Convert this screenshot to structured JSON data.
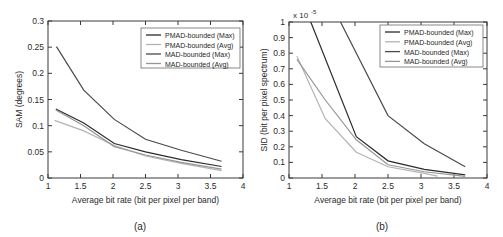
{
  "figure": {
    "background": "#ffffff",
    "panels": [
      "a",
      "b"
    ]
  },
  "colors": {
    "dark": "#2b2b2b",
    "mid_dark": "#4a4a4a",
    "light_gray": "#b3b3b3",
    "mid_gray": "#969696",
    "axis": "#3a3a3a"
  },
  "legend": {
    "entries": [
      {
        "label": "PMAD-bounded (Max)",
        "color": "#2b2b2b"
      },
      {
        "label": "PMAD-bounded (Avg)",
        "color": "#b3b3b3"
      },
      {
        "label": "MAD-bounded (Max)",
        "color": "#4a4a4a"
      },
      {
        "label": "MAD-bounded (Avg)",
        "color": "#969696"
      }
    ]
  },
  "chart_data": [
    {
      "type": "line",
      "panel": "a",
      "caption": "(a)",
      "title": "",
      "xlabel": "Average bit rate (bit per pixel per band)",
      "ylabel": "SAM (degrees)",
      "xlim": [
        1,
        4
      ],
      "ylim": [
        0,
        0.3
      ],
      "xticks": [
        1,
        1.5,
        2,
        2.5,
        3,
        3.5,
        4
      ],
      "xticklabels": [
        "1",
        "1.5",
        "2",
        "2.5",
        "3",
        "3.5",
        "4"
      ],
      "yticks": [
        0,
        0.05,
        0.1,
        0.15,
        0.2,
        0.25,
        0.3
      ],
      "yticklabels": [
        "0",
        "0.05",
        "0.1",
        "0.15",
        "0.2",
        "0.25",
        "0.3"
      ],
      "grid": false,
      "legend_position": "top-right",
      "series": [
        {
          "name": "PMAD-bounded (Max)",
          "color": "#2b2b2b",
          "x": [
            1.12,
            1.55,
            2.02,
            2.5,
            3.05,
            3.67
          ],
          "y": [
            0.132,
            0.105,
            0.066,
            0.05,
            0.035,
            0.022
          ]
        },
        {
          "name": "PMAD-bounded (Avg)",
          "color": "#b3b3b3",
          "x": [
            1.1,
            1.55,
            2.02,
            2.5,
            3.05,
            3.67
          ],
          "y": [
            0.11,
            0.09,
            0.062,
            0.042,
            0.028,
            0.014
          ]
        },
        {
          "name": "MAD-bounded (Max)",
          "color": "#4a4a4a",
          "x": [
            1.13,
            1.55,
            2.02,
            2.5,
            3.05,
            3.67
          ],
          "y": [
            0.251,
            0.168,
            0.112,
            0.074,
            0.053,
            0.032
          ]
        },
        {
          "name": "MAD-bounded (Avg)",
          "color": "#969696",
          "x": [
            1.12,
            1.55,
            2.02,
            2.5,
            3.05,
            3.67
          ],
          "y": [
            0.13,
            0.1,
            0.06,
            0.044,
            0.03,
            0.017
          ]
        }
      ]
    },
    {
      "type": "line",
      "panel": "b",
      "caption": "(b)",
      "title": "",
      "exponent_label": "x 10",
      "exponent_power": "-5",
      "xlabel": "Average bit rate (bit per pixel per band)",
      "ylabel": "SID (bit per pixel spectrum)",
      "xlim": [
        1,
        4
      ],
      "ylim": [
        0,
        1
      ],
      "xticks": [
        1,
        1.5,
        2,
        2.5,
        3,
        3.5,
        4
      ],
      "xticklabels": [
        "1",
        "1.5",
        "2",
        "2.5",
        "3",
        "3.5",
        "4"
      ],
      "yticks": [
        0,
        0.1,
        0.2,
        0.3,
        0.4,
        0.5,
        0.6,
        0.7,
        0.8,
        0.9,
        1
      ],
      "yticklabels": [
        "0",
        "0.1",
        "0.2",
        "0.3",
        "0.4",
        "0.5",
        "0.6",
        "0.7",
        "0.8",
        "0.9",
        "1"
      ],
      "grid": false,
      "legend_position": "top-right",
      "series": [
        {
          "name": "PMAD-bounded (Max)",
          "color": "#2b2b2b",
          "x": [
            1.33,
            2.02,
            2.5,
            3.05,
            3.67
          ],
          "y": [
            1.0,
            0.265,
            0.11,
            0.055,
            0.02
          ]
        },
        {
          "name": "PMAD-bounded (Avg)",
          "color": "#b3b3b3",
          "x": [
            1.12,
            1.55,
            2.02,
            2.5,
            3.05,
            3.25
          ],
          "y": [
            0.78,
            0.38,
            0.165,
            0.072,
            0.03,
            0.012
          ]
        },
        {
          "name": "MAD-bounded (Max)",
          "color": "#4a4a4a",
          "x": [
            1.78,
            2.5,
            3.05,
            3.67
          ],
          "y": [
            1.0,
            0.4,
            0.22,
            0.072
          ]
        },
        {
          "name": "MAD-bounded (Avg)",
          "color": "#969696",
          "x": [
            1.12,
            1.55,
            2.02,
            2.5,
            3.05,
            3.67
          ],
          "y": [
            0.76,
            0.5,
            0.245,
            0.085,
            0.04,
            0.01
          ]
        }
      ]
    }
  ]
}
